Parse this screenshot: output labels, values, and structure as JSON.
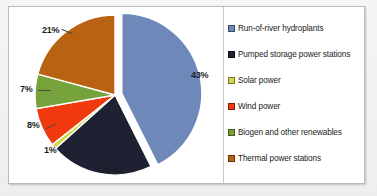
{
  "chart_data": {
    "type": "pie",
    "title": "",
    "subtitle": "",
    "xlabel": "",
    "ylabel": "",
    "legend_position": "right",
    "grid": false,
    "unit": "%",
    "exploded_slice": "Run-of-river hydroplants",
    "categories": [
      "Run-of-river hydroplants",
      "Pumped storage power stations",
      "Solar power",
      "Wind power",
      "Biogen and other renewables",
      "Thermal power stations"
    ],
    "values": [
      43,
      21,
      1,
      8,
      7,
      21
    ],
    "colors": [
      "#6F88BA",
      "#1E2131",
      "#D4D74C",
      "#F0390C",
      "#76A23C",
      "#B96312"
    ],
    "data_labels": [
      "43%",
      "21%",
      "1%",
      "8%",
      "7%",
      "21%"
    ],
    "slices": [
      {
        "label": "Run-of-river hydroplants",
        "value": 43,
        "display": "43%",
        "color": "#6F88BA"
      },
      {
        "label": "Pumped storage power stations",
        "value": 21,
        "display": "21%",
        "color": "#1E2131"
      },
      {
        "label": "Solar power",
        "value": 1,
        "display": "1%",
        "color": "#D4D74C"
      },
      {
        "label": "Wind power",
        "value": 8,
        "display": "8%",
        "color": "#F0390C"
      },
      {
        "label": "Biogen and other renewables",
        "value": 7,
        "display": "7%",
        "color": "#76A23C"
      },
      {
        "label": "Thermal power stations",
        "value": 21,
        "display": "21%",
        "color": "#B96312"
      }
    ]
  },
  "legend": {
    "items": [
      {
        "label": "Run-of-river hydroplants",
        "color": "#6F88BA"
      },
      {
        "label": "Pumped storage power stations",
        "color": "#1E2131"
      },
      {
        "label": "Solar power",
        "color": "#D4D74C"
      },
      {
        "label": "Wind power",
        "color": "#F0390C"
      },
      {
        "label": "Biogen and other renewables",
        "color": "#76A23C"
      },
      {
        "label": "Thermal power stations",
        "color": "#B96312"
      }
    ]
  },
  "labels": {
    "blue": "43%",
    "navy": "21%",
    "yellow": "1%",
    "red": "8%",
    "green": "7%",
    "brown": "21%"
  }
}
